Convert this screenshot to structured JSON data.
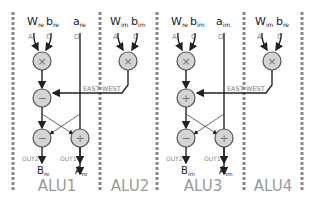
{
  "diagram": {
    "colors": {
      "node_fill": "#d4d4d4",
      "node_stroke": "#555555",
      "wire": "#222222",
      "divider": "#888888",
      "alu_label": "#9a9a9a"
    },
    "alus": [
      {
        "label": "ALU1",
        "inputs": [
          {
            "name": "W",
            "sub": "re",
            "port": "A"
          },
          {
            "name": "b",
            "sub": "re",
            "port": "C"
          },
          {
            "name": "a",
            "sub": "re",
            "port": "D"
          }
        ],
        "ops": [
          "×",
          "−",
          "−",
          "+"
        ],
        "outputs": [
          {
            "port": "OUT2",
            "name": "B",
            "sub": "re"
          },
          {
            "port": "OUT1",
            "name": "A",
            "sub": "re"
          }
        ]
      },
      {
        "label": "ALU2",
        "inputs": [
          {
            "name": "W",
            "sub": "im",
            "port": "A"
          },
          {
            "name": "b",
            "sub": "im",
            "port": "C"
          }
        ],
        "ops": [
          "×"
        ]
      },
      {
        "label": "ALU3",
        "inputs": [
          {
            "name": "W",
            "sub": "re",
            "port": "A"
          },
          {
            "name": "b",
            "sub": "im",
            "port": "C"
          },
          {
            "name": "a",
            "sub": "im",
            "port": "D"
          }
        ],
        "ops": [
          "×",
          "+",
          "−",
          "+"
        ],
        "outputs": [
          {
            "port": "OUT2",
            "name": "B",
            "sub": "im"
          },
          {
            "port": "OUT1",
            "name": "A",
            "sub": "im"
          }
        ]
      },
      {
        "label": "ALU4",
        "inputs": [
          {
            "name": "W",
            "sub": "im",
            "port": "A"
          },
          {
            "name": "b",
            "sub": "re",
            "port": "C"
          }
        ],
        "ops": [
          "×"
        ]
      }
    ],
    "link_label_left": "EAST",
    "link_label_right": "WEST"
  }
}
